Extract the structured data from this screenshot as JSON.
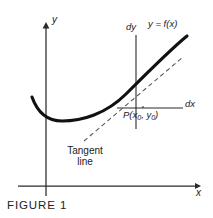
{
  "figure": {
    "caption": "FIGURE 1",
    "axes": {
      "y_label": "y",
      "x_label": "x",
      "dy_label": "dy",
      "dx_label": "dx"
    },
    "labels": {
      "curve_equation": "y = f(x)",
      "point": "P(x",
      "point_sub1": "0",
      "point_mid": ", y",
      "point_sub2": "0",
      "point_end": ")",
      "tangent_line_1": "Tangent",
      "tangent_line_2": "line"
    },
    "colors": {
      "ink": "#1a1a1a",
      "curve": "#111111",
      "axis": "#2b2b2b",
      "tangent": "#4a4a4a",
      "background": "#ffffff"
    },
    "geometry": {
      "x_axis_y": 186,
      "y_axis_x": 46,
      "dx_line_y": 108,
      "dy_line_x": 136,
      "point_x": 143,
      "point_y": 108,
      "curve_min_x": 62,
      "curve_min_y": 121
    }
  }
}
